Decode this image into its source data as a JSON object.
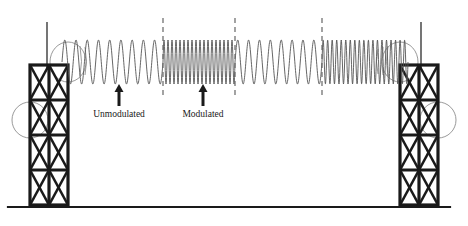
{
  "diagram": {
    "background_color": "#ffffff",
    "line_color": "#1a1a1a",
    "wave_color": "#555555",
    "dashed_color": "#666666",
    "labels": [
      {
        "id": "unmodulated",
        "text": "Unmodulated",
        "x": 119,
        "y": 117
      },
      {
        "id": "modulated",
        "text": "Modulated",
        "x": 203,
        "y": 117
      }
    ],
    "arrows": [
      {
        "id": "arrow-unmodulated",
        "x": 119,
        "y_tip": 84,
        "y_tail": 106
      },
      {
        "id": "arrow-modulated",
        "x": 203,
        "y_tip": 84,
        "y_tail": 106
      }
    ],
    "dashed_lines": [
      {
        "id": "boundary-1",
        "x": 163,
        "y_top": 18,
        "y_bottom": 98
      },
      {
        "id": "boundary-2",
        "x": 235,
        "y_top": 18,
        "y_bottom": 98
      },
      {
        "id": "boundary-3",
        "x": 322,
        "y_top": 18,
        "y_bottom": 98
      }
    ],
    "ground_line": {
      "x_start": 8,
      "x_end": 450,
      "y": 207,
      "thickness": 2.2
    },
    "wave": {
      "baseline_y": 62,
      "amplitude": 22,
      "x_start": 62,
      "x_end": 408,
      "segments": [
        {
          "id": "segment-unmodulated-left",
          "x_start": 62,
          "x_end": 163,
          "cycles": 9,
          "type": "low-frequency"
        },
        {
          "id": "segment-modulated-left",
          "x_start": 163,
          "x_end": 235,
          "cycles": 18,
          "type": "high-frequency"
        },
        {
          "id": "segment-unmodulated-right",
          "x_start": 235,
          "x_end": 322,
          "cycles": 8,
          "type": "low-frequency"
        },
        {
          "id": "segment-modulated-right",
          "x_start": 322,
          "x_end": 408,
          "cycles": 19,
          "type": "high-frequency"
        }
      ]
    },
    "towers": [
      {
        "id": "tower-left",
        "side": "left",
        "x": 30,
        "y_top": 65,
        "width": 38,
        "height": 140,
        "columns": 2,
        "rows": 4,
        "mast": {
          "x": 47,
          "y_top": 22,
          "y_bottom": 65
        },
        "dishes": [
          {
            "id": "dish-upper-left",
            "cx": 68,
            "cy": 62,
            "rx": 18,
            "ry": 20
          },
          {
            "id": "dish-lower-left",
            "cx": 30,
            "cy": 120,
            "rx": 18,
            "ry": 18
          }
        ]
      },
      {
        "id": "tower-right",
        "side": "right",
        "x": 400,
        "y_top": 65,
        "width": 38,
        "height": 140,
        "columns": 2,
        "rows": 4,
        "mast": {
          "x": 421,
          "y_top": 22,
          "y_bottom": 65
        },
        "dishes": [
          {
            "id": "dish-upper-right",
            "cx": 400,
            "cy": 62,
            "rx": 18,
            "ry": 20
          },
          {
            "id": "dish-lower-right",
            "cx": 438,
            "cy": 120,
            "rx": 18,
            "ry": 18
          }
        ]
      }
    ]
  }
}
